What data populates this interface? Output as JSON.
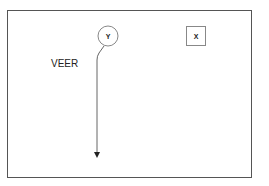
{
  "diagram": {
    "nodes": [
      {
        "id": "Y",
        "label": "Y",
        "shape": "circle",
        "cx": 108,
        "cy": 36,
        "r": 10
      },
      {
        "id": "X",
        "label": "X",
        "shape": "square",
        "x": 186,
        "y": 26,
        "size": 20
      }
    ],
    "annotations": [
      {
        "text": "VEER"
      }
    ],
    "edges": [
      {
        "from": "Y",
        "to": "bottom",
        "style": "arrow",
        "path": "veer then straight down"
      }
    ],
    "colors": {
      "stroke": "#555555",
      "text": "#222222"
    }
  }
}
